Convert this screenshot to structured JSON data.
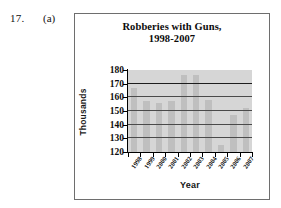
{
  "exercise": {
    "number": "17.",
    "part": "(a)"
  },
  "chart_data": {
    "type": "bar",
    "title": "Robberies with Guns, 1998-2007",
    "title_lines": [
      "Robberies with Guns,",
      "1998-2007"
    ],
    "xlabel": "Year",
    "ylabel": "Thousands",
    "categories": [
      "1998",
      "1999",
      "2000",
      "2001",
      "2002",
      "2003",
      "2004",
      "2005",
      "2006",
      "2007"
    ],
    "values": [
      167,
      157,
      156,
      157,
      176,
      176,
      158,
      125,
      147,
      152
    ],
    "ylim": [
      120,
      180
    ],
    "yticks": [
      180,
      170,
      160,
      150,
      140,
      130,
      120
    ],
    "ytick_labels": [
      "180",
      "170",
      "160",
      "150",
      "140",
      "130",
      "120"
    ],
    "grid": true,
    "legend": false,
    "bar_color": "#bfbfbf",
    "plot_background": "#d6d6d6",
    "axis_color": "#000000"
  }
}
